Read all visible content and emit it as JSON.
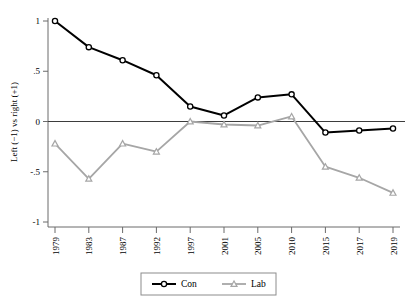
{
  "chart_data": {
    "type": "line",
    "title": "",
    "xlabel": "",
    "ylabel": "Left (−1) vs right (+1)",
    "categories": [
      "1979",
      "1983",
      "1987",
      "1992",
      "1997",
      "2001",
      "2005",
      "2010",
      "2015",
      "2017",
      "2019"
    ],
    "ylim": [
      -1,
      1
    ],
    "yticks": [
      1,
      0.5,
      0,
      -0.5,
      -1
    ],
    "ytick_labels": [
      "1",
      ".5",
      "0",
      "-.5",
      "-1"
    ],
    "grid": false,
    "zero_line": true,
    "legend_position": "bottom-center",
    "series": [
      {
        "name": "Con",
        "color": "#000000",
        "marker": "circle",
        "values": [
          1.0,
          0.74,
          0.61,
          0.46,
          0.15,
          0.06,
          0.24,
          0.27,
          -0.11,
          -0.09,
          -0.07
        ]
      },
      {
        "name": "Lab",
        "color": "#a6a6a6",
        "marker": "triangle",
        "values": [
          -0.22,
          -0.57,
          -0.22,
          -0.3,
          0.0,
          -0.03,
          -0.04,
          0.05,
          -0.45,
          -0.56,
          -0.71
        ]
      }
    ]
  },
  "legend": {
    "items": [
      {
        "label": "Con"
      },
      {
        "label": "Lab"
      }
    ]
  },
  "axes": {
    "y_title": "Left (−1) vs right (+1)"
  }
}
